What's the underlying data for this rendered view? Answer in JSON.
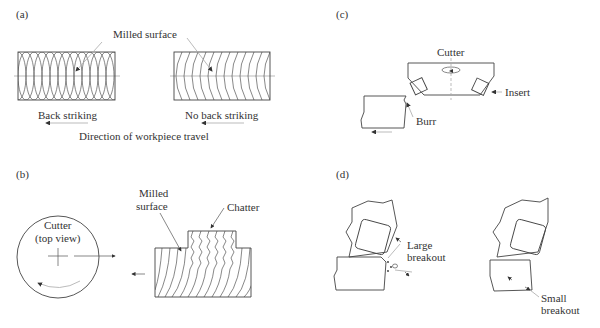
{
  "figure": {
    "panels": {
      "a": {
        "label": "(a)",
        "milled_surface": "Milled surface",
        "back_striking": "Back striking",
        "no_back_striking": "No back striking",
        "direction": "Direction of workpiece travel"
      },
      "b": {
        "label": "(b)",
        "cutter_line1": "Cutter",
        "cutter_line2": "(top view)",
        "milled_line1": "Milled",
        "milled_line2": "surface",
        "chatter": "Chatter"
      },
      "c": {
        "label": "(c)",
        "cutter": "Cutter",
        "insert": "Insert",
        "burr": "Burr"
      },
      "d": {
        "label": "(d)",
        "large_line1": "Large",
        "large_line2": "breakout",
        "small_line1": "Small",
        "small_line2": "breakout"
      }
    },
    "colors": {
      "line": "#444444",
      "text": "#333333",
      "background": "#ffffff"
    }
  }
}
